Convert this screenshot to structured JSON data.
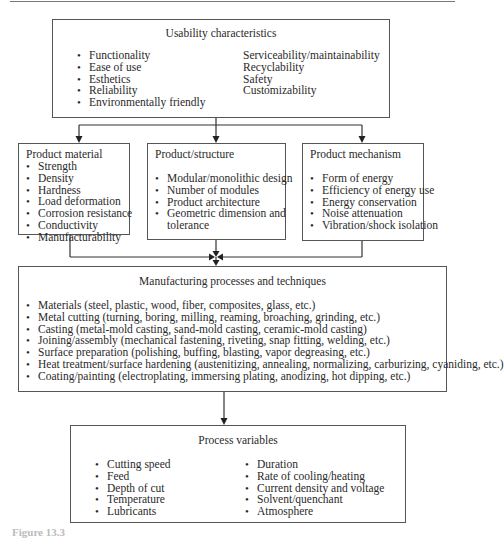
{
  "usability": {
    "title": "Usability characteristics",
    "left_items": [
      "Functionality",
      "Ease of use",
      "Esthetics",
      "Reliability",
      "Environmentally friendly"
    ],
    "right_items": [
      "Serviceability/maintainability",
      "Recyclability",
      "Safety",
      "Customizability"
    ]
  },
  "product_material": {
    "title": "Product material",
    "items": [
      "Strength",
      "Density",
      "Hardness",
      "Load deformation",
      "Corrosion resistance",
      "Conductivity",
      "Manufacturability"
    ]
  },
  "product_structure": {
    "title": "Product/structure",
    "items": [
      "Modular/monolithic design",
      "Number of modules",
      "Product architecture",
      "Geometric dimension and"
    ],
    "continuation": "tolerance"
  },
  "product_mechanism": {
    "title": "Product mechanism",
    "items": [
      "Form of energy",
      "Efficiency of energy use",
      "Energy conservation",
      "Noise attenuation",
      "Vibration/shock isolation"
    ]
  },
  "manufacturing": {
    "title": "Manufacturing processes and techniques",
    "items": [
      "Materials (steel, plastic, wood, fiber, composites, glass, etc.)",
      "Metal cutting (turning, boring, milling, reaming, broaching, grinding, etc.)",
      "Casting (metal-mold casting, sand-mold casting, ceramic-mold casting)",
      "Joining/assembly (mechanical fastening, riveting, snap fitting, welding, etc.)",
      "Surface preparation (polishing, buffing, blasting, vapor degreasing, etc.)",
      "Heat treatment/surface hardening (austenitizing, annealing, normalizing, carburizing, cyaniding, etc.)",
      "Coating/painting (electroplating, immersing plating, anodizing, hot dipping, etc.)"
    ]
  },
  "process_variables": {
    "title": "Process variables",
    "left_items": [
      "Cutting speed",
      "Feed",
      "Depth of cut",
      "Temperature",
      "Lubricants"
    ],
    "right_items": [
      "Duration",
      "Rate of cooling/heating",
      "Current density and voltage",
      "Solvent/quenchant",
      "Atmosphere"
    ]
  },
  "caption": "Figure 13.3"
}
